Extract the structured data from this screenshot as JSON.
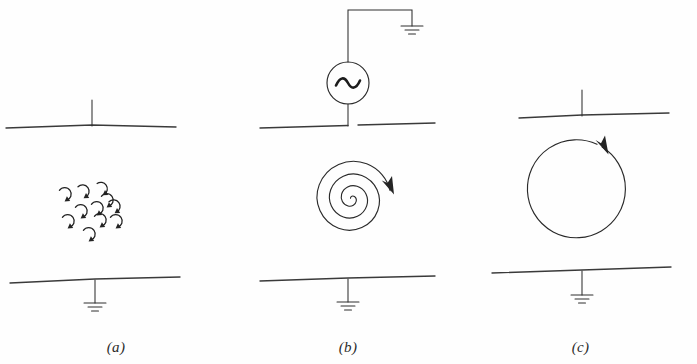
{
  "figure": {
    "background_color": "#ffffff",
    "ink_color": "#2a2a2a",
    "panel_count": 3
  },
  "panels": [
    {
      "id": "a",
      "caption": "(a)",
      "content_name": "random-eddy-currents",
      "top_element": "capacitor-top-plate-with-lead",
      "bottom_element": "capacitor-bottom-plate-with-ground",
      "middle_element": "cluster-of-circulating-arrows",
      "eddy_count": 11,
      "eddy_radius_px": 6.5,
      "eddies": [
        {
          "cx": 64,
          "cy": 194,
          "start_deg": 150,
          "sweep_deg": 300
        },
        {
          "cx": 83,
          "cy": 191,
          "start_deg": 140,
          "sweep_deg": 300
        },
        {
          "cx": 102,
          "cy": 188,
          "start_deg": 135,
          "sweep_deg": 300
        },
        {
          "cx": 96,
          "cy": 208,
          "start_deg": 150,
          "sweep_deg": 300
        },
        {
          "cx": 114,
          "cy": 206,
          "start_deg": 140,
          "sweep_deg": 300
        },
        {
          "cx": 80,
          "cy": 211,
          "start_deg": 150,
          "sweep_deg": 300
        },
        {
          "cx": 67,
          "cy": 221,
          "start_deg": 150,
          "sweep_deg": 300
        },
        {
          "cx": 99,
          "cy": 220,
          "start_deg": 150,
          "sweep_deg": 300
        },
        {
          "cx": 115,
          "cy": 221,
          "start_deg": 150,
          "sweep_deg": 300
        },
        {
          "cx": 88,
          "cy": 234,
          "start_deg": 150,
          "sweep_deg": 300
        },
        {
          "cx": 106,
          "cy": 200,
          "start_deg": 150,
          "sweep_deg": 300
        }
      ]
    },
    {
      "id": "b",
      "caption": "(b)",
      "content_name": "spiral-displacement-current",
      "top_element": "ac-source-with-ground-lead",
      "bottom_element": "capacitor-bottom-plate-with-ground",
      "middle_element": "spiral-arrow",
      "source_symbol": "~",
      "source_type": "ac-voltage-source",
      "spiral_turns": 3.6,
      "spiral_direction": "clockwise",
      "spiral_center": {
        "x": 348,
        "y": 198
      },
      "spiral_outer_radius_px": 46
    },
    {
      "id": "c",
      "caption": "(c)",
      "content_name": "single-circular-current-loop",
      "top_element": "capacitor-top-plate-with-lead",
      "bottom_element": "capacitor-bottom-plate-with-ground",
      "middle_element": "circular-arrow",
      "circle_center": {
        "x": 582,
        "y": 196
      },
      "circle_radius_px": 49,
      "circle_direction": "clockwise"
    }
  ],
  "symbols": {
    "ground": {
      "name": "earth-ground",
      "bar_count": 3,
      "bar_widths_px": [
        22,
        14,
        7
      ]
    },
    "ac_source": {
      "name": "ac-source",
      "circle_radius_px": 21,
      "glyph": "sine-wave"
    }
  }
}
